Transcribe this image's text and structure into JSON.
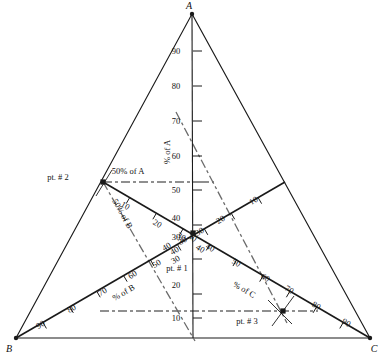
{
  "figure": {
    "type": "ternary-diagram",
    "title": "",
    "background": "#ffffff",
    "line_color": "#1a1a1a",
    "dash_color": "#6b6b6b"
  },
  "vertices": [
    {
      "name": "A",
      "label": "A",
      "x": 192,
      "y": 14,
      "label_x": 189,
      "label_y": 9
    },
    {
      "name": "B",
      "label": "B",
      "x": 16,
      "y": 338,
      "label_x": 9,
      "label_y": 352
    },
    {
      "name": "C",
      "label": "C",
      "x": 370,
      "y": 338,
      "label_x": 374,
      "label_y": 352
    }
  ],
  "axes": [
    {
      "id": "axis-a",
      "name": "% of A",
      "label": "% of A",
      "label_x": 170,
      "label_y": 152,
      "label_rotate": -90,
      "ticks": [
        10,
        20,
        30,
        40,
        50,
        60,
        70,
        80,
        90
      ]
    },
    {
      "id": "axis-b",
      "name": "% of B",
      "label": "% of B",
      "label_x": 125,
      "label_y": 295,
      "label_rotate": -30,
      "ticks": [
        10,
        20,
        30,
        40,
        50,
        60,
        70,
        80,
        90
      ]
    },
    {
      "id": "axis-c",
      "name": "% of C",
      "label": "% of C",
      "label_x": 243,
      "label_y": 292,
      "label_rotate": 30,
      "ticks": [
        10,
        20,
        30,
        40,
        50,
        60,
        70,
        80,
        90
      ]
    }
  ],
  "axis_a_numbers": [
    {
      "v": "90",
      "x": 176,
      "y": 51
    },
    {
      "v": "80",
      "x": 176,
      "y": 86
    },
    {
      "v": "70",
      "x": 176,
      "y": 121
    },
    {
      "v": "60",
      "x": 176,
      "y": 156
    },
    {
      "v": "50",
      "x": 176,
      "y": 190
    },
    {
      "v": "40",
      "x": 176,
      "y": 218
    },
    {
      "v": "30",
      "x": 176,
      "y": 237
    },
    {
      "v": "20",
      "x": 176,
      "y": 285
    },
    {
      "v": "10",
      "x": 176,
      "y": 318
    }
  ],
  "axis_b_numbers": [
    {
      "v": "90",
      "x": 42,
      "y": 327,
      "r": -31
    },
    {
      "v": "80",
      "x": 73,
      "y": 311,
      "r": -31
    },
    {
      "v": "70",
      "x": 104,
      "y": 294,
      "r": -31
    },
    {
      "v": "60",
      "x": 134,
      "y": 277,
      "r": -31
    },
    {
      "v": "50",
      "x": 158,
      "y": 266,
      "r": -31
    },
    {
      "v": "40",
      "x": 176,
      "y": 253,
      "r": -31
    },
    {
      "v": "30",
      "x": 184,
      "y": 243,
      "r": -31
    }
  ],
  "axis_c_numbers": [
    {
      "v": "90",
      "x": 345,
      "y": 325,
      "r": 31
    },
    {
      "v": "80",
      "x": 315,
      "y": 308,
      "r": 31
    },
    {
      "v": "70",
      "x": 288,
      "y": 292,
      "r": 31
    },
    {
      "v": "60",
      "x": 264,
      "y": 280,
      "r": 31
    },
    {
      "v": "50",
      "x": 235,
      "y": 265,
      "r": 31
    },
    {
      "v": "40",
      "x": 209,
      "y": 250,
      "r": 31
    },
    {
      "v": "30",
      "x": 191,
      "y": 240,
      "r": 31
    }
  ],
  "arm_ne_numbers": [
    {
      "v": "10",
      "x": 255,
      "y": 203,
      "r": -31
    },
    {
      "v": "20",
      "x": 222,
      "y": 222,
      "r": -31
    },
    {
      "v": "30",
      "x": 201,
      "y": 234,
      "r": -31
    }
  ],
  "arm_nw_numbers": [
    {
      "v": "10",
      "x": 124,
      "y": 208,
      "r": 31
    },
    {
      "v": "20",
      "x": 156,
      "y": 226,
      "r": 31
    },
    {
      "v": "30",
      "x": 180,
      "y": 239,
      "r": 31
    }
  ],
  "center_small_numbers": [
    {
      "v": "40",
      "x": 168,
      "y": 249,
      "r": -31
    },
    {
      "v": "30",
      "x": 177,
      "y": 262,
      "r": -31
    },
    {
      "v": "40",
      "x": 199,
      "y": 251,
      "r": 31
    }
  ],
  "guides": [
    {
      "id": "guide-50-a",
      "label": "50% of A",
      "label_x": 128,
      "label_y": 174,
      "label_rotate": 0,
      "x1": 103,
      "y1": 182,
      "x2": 200,
      "y2": 182
    },
    {
      "id": "guide-50-b",
      "label": "50% of B",
      "label_x": 120,
      "label_y": 215,
      "label_rotate": 61,
      "x1": 103,
      "y1": 182,
      "x2": 195,
      "y2": 341
    },
    {
      "id": "guide-pct-c-dashdot",
      "label": "",
      "label_x": 0,
      "label_y": 0,
      "label_rotate": 0,
      "x1": 176,
      "y1": 112,
      "x2": 287,
      "y2": 323
    },
    {
      "id": "guide-10-c",
      "label": "",
      "label_x": 0,
      "label_y": 0,
      "label_rotate": 0,
      "x1": 100,
      "y1": 311,
      "x2": 318,
      "y2": 311
    }
  ],
  "points": [
    {
      "id": "pt-1",
      "label": "pt. # 1",
      "x": 193,
      "y": 233,
      "label_x": 177,
      "label_y": 271,
      "values": {
        "A": 30,
        "B": 40,
        "C": 30
      }
    },
    {
      "id": "pt-2",
      "label": "pt. # 2",
      "x": 103,
      "y": 182,
      "label_x": 58,
      "label_y": 180,
      "values": {
        "A": 50,
        "B": 50,
        "C": 0
      }
    },
    {
      "id": "pt-3",
      "label": "pt. # 3",
      "x": 283,
      "y": 311,
      "label_x": 247,
      "label_y": 324,
      "values": {
        "A": 10,
        "B": 20,
        "C": 70
      }
    }
  ],
  "chart_data": {
    "type": "scatter",
    "subtype": "ternary",
    "title": "",
    "xlabel": "",
    "ylabel": "",
    "axis_labels": [
      "% of A",
      "% of B",
      "% of C"
    ],
    "corner_labels": [
      "A",
      "B",
      "C"
    ],
    "tick_labels": [
      10,
      20,
      30,
      40,
      50,
      60,
      70,
      80,
      90
    ],
    "axis_ranges": [
      [
        0,
        100
      ],
      [
        0,
        100
      ],
      [
        0,
        100
      ]
    ],
    "grid": false,
    "legend": "none",
    "annotations": [
      "50% of A",
      "50% of B",
      "% of A",
      "% of B",
      "% of C",
      "pt. # 1",
      "pt. # 2",
      "pt. # 3"
    ],
    "series": [
      {
        "name": "points",
        "points": [
          {
            "label": "pt. # 1",
            "A": 30,
            "B": 40,
            "C": 30
          },
          {
            "label": "pt. # 2",
            "A": 50,
            "B": 50,
            "C": 0
          },
          {
            "label": "pt. # 3",
            "A": 10,
            "B": 20,
            "C": 70
          }
        ]
      }
    ]
  }
}
